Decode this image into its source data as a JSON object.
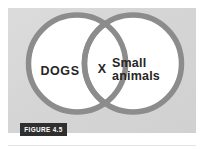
{
  "figure": {
    "caption_badge": "FIGURE 4.5",
    "diagram_type": "venn",
    "panel_background_color": "#d7d7d7",
    "circle_fill_color": "#ffffff",
    "circle_stroke_color": "#8c8c8c",
    "text_color": "#262626",
    "badge_background_color": "#2f2f2f",
    "badge_text_color": "#ffffff",
    "sets": [
      {
        "id": "left",
        "label": "DOGS"
      },
      {
        "id": "right",
        "label": "Small\nanimals"
      }
    ],
    "intersection": {
      "label": "X"
    }
  }
}
